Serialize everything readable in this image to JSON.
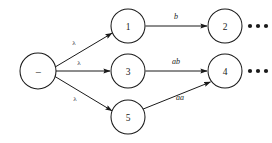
{
  "diagram": {
    "type": "directed-graph-tree",
    "background_color": "#ffffff",
    "stroke_color": "#1a1a1a",
    "root": {
      "id": "root",
      "label": "−",
      "cx": 38,
      "cy": 71,
      "r": 18
    },
    "nodes": [
      {
        "id": "n1",
        "label": "1",
        "cx": 128,
        "cy": 26,
        "r": 17
      },
      {
        "id": "n2",
        "label": "2",
        "cx": 225,
        "cy": 26,
        "r": 17
      },
      {
        "id": "n3",
        "label": "3",
        "cx": 128,
        "cy": 71,
        "r": 17
      },
      {
        "id": "n4",
        "label": "4",
        "cx": 225,
        "cy": 71,
        "r": 17
      },
      {
        "id": "n5",
        "label": "5",
        "cx": 128,
        "cy": 117,
        "r": 17
      }
    ],
    "edges": [
      {
        "id": "e-root-n1",
        "from": "root",
        "to": "n1",
        "label": "λ",
        "label_style": "lambda",
        "label_x": 74,
        "label_y": 43
      },
      {
        "id": "e-root-n3",
        "from": "root",
        "to": "n3",
        "label": "λ",
        "label_style": "lambda",
        "label_x": 79,
        "label_y": 63
      },
      {
        "id": "e-root-n5",
        "from": "root",
        "to": "n5",
        "label": "λ",
        "label_style": "lambda",
        "label_x": 75,
        "label_y": 99
      },
      {
        "id": "e-n1-n2",
        "from": "n1",
        "to": "n2",
        "label": "b",
        "label_style": "italic",
        "label_x": 176,
        "label_y": 16
      },
      {
        "id": "e-n3-n4",
        "from": "n3",
        "to": "n4",
        "label": "ab",
        "label_style": "italic",
        "label_x": 176,
        "label_y": 61
      },
      {
        "id": "e-n5-n4",
        "from": "n5",
        "to": "n4",
        "label": "aa",
        "label_style": "italic",
        "label_x": 180,
        "label_y": 97
      }
    ],
    "continuations": [
      {
        "id": "ellipsis-row-top",
        "after_node": "n2",
        "glyph": "•••",
        "cx": 258,
        "cy": 26
      },
      {
        "id": "ellipsis-row-middle",
        "after_node": "n4",
        "glyph": "•••",
        "cx": 258,
        "cy": 71
      }
    ]
  }
}
